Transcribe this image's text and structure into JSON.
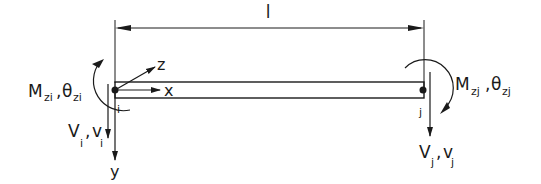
{
  "diagram": {
    "type": "beam-element",
    "length_label": "l",
    "beam": {
      "color": "#1a1a1a"
    },
    "node_i": {
      "label": "i",
      "moment_label": "M",
      "moment_sub": "zi",
      "rotation_label": "θ",
      "rotation_sub": "zi",
      "shear_label": "V",
      "shear_sub": "i",
      "disp_label": "v",
      "disp_sub": "i"
    },
    "node_j": {
      "label": "j",
      "moment_label": "M",
      "moment_sub": "zj",
      "rotation_label": "θ",
      "rotation_sub": "zj",
      "shear_label": "V",
      "shear_sub": "j",
      "disp_label": "v",
      "disp_sub": "j"
    },
    "axes": {
      "x": "x",
      "y": "y",
      "z": "z"
    }
  }
}
